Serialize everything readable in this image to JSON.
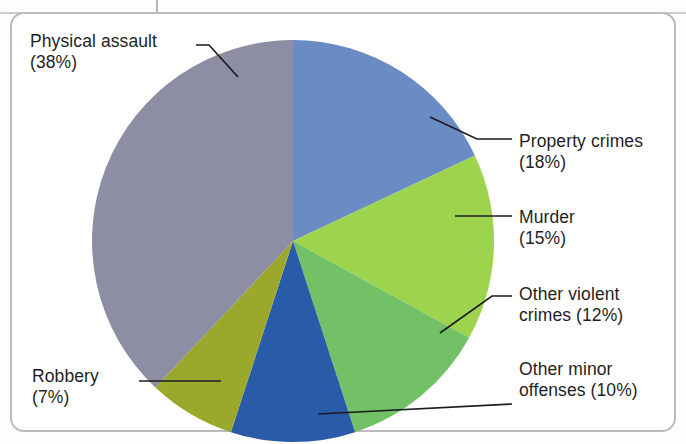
{
  "figure": {
    "border_color": "#b9bbbf",
    "background": "#ffffff"
  },
  "chart_data": {
    "type": "pie",
    "title": "",
    "subtitle": "",
    "xlabel": "",
    "ylabel": "",
    "legend_position": "callout-labels",
    "grid": false,
    "total": 100,
    "units": "%",
    "start_angle_deg": 0,
    "direction": "clockwise",
    "categories": [
      "Property crimes",
      "Murder",
      "Other violent crimes",
      "Other minor offenses",
      "Robbery",
      "Physical assault"
    ],
    "values": [
      18,
      15,
      12,
      10,
      7,
      38
    ],
    "colors": [
      "#6a8bc4",
      "#9ed34e",
      "#72c166",
      "#2a5ba8",
      "#9aa82c",
      "#8d8da4"
    ],
    "slices": [
      {
        "label": "Property crimes",
        "value": 18,
        "display": "Property crimes\n(18%)",
        "color": "#6a8bc4"
      },
      {
        "label": "Murder",
        "value": 15,
        "display": "Murder\n(15%)",
        "color": "#9ed34e"
      },
      {
        "label": "Other violent crimes",
        "value": 12,
        "display": "Other violent\ncrimes (12%)",
        "color": "#72c166"
      },
      {
        "label": "Other minor offenses",
        "value": 10,
        "display": "Other minor\noffenses (10%)",
        "color": "#2a5ba8"
      },
      {
        "label": "Robbery",
        "value": 7,
        "display": "Robbery\n(7%)",
        "color": "#9aa82c"
      },
      {
        "label": "Physical assault",
        "value": 38,
        "display": "Physical assault\n(38%)",
        "color": "#8d8da4"
      }
    ]
  },
  "labels": {
    "physical_assault": "Physical assault\n(38%)",
    "property_crimes": "Property crimes\n(18%)",
    "murder": "Murder\n(15%)",
    "other_violent_crimes": "Other violent\ncrimes (12%)",
    "other_minor_offenses": "Other minor\noffenses (10%)",
    "robbery": "Robbery\n(7%)"
  }
}
